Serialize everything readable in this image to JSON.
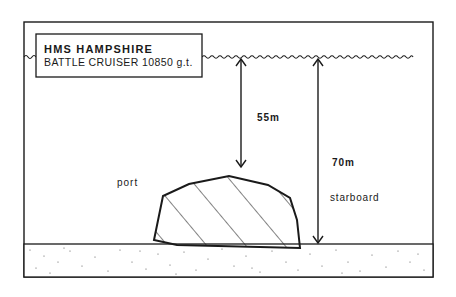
{
  "diagram": {
    "type": "shipwreck-depth-profile",
    "ship": {
      "name": "HMS HAMPSHIRE",
      "description": "BATTLE CRUISER  10850 g.t."
    },
    "measurements": [
      {
        "label": "55m",
        "meaning": "surface to top of wreck"
      },
      {
        "label": "70m",
        "meaning": "surface to seabed"
      }
    ],
    "sides": {
      "port": "port",
      "starboard": "starboard"
    },
    "colors": {
      "ink": "#1a1a1a",
      "background": "#ffffff"
    }
  }
}
